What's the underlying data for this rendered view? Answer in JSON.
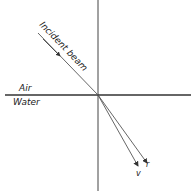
{
  "diagram": {
    "labels": {
      "incident": "Incident beam",
      "air": "Air",
      "water": "Water",
      "violet": "v",
      "red": "r"
    }
  }
}
